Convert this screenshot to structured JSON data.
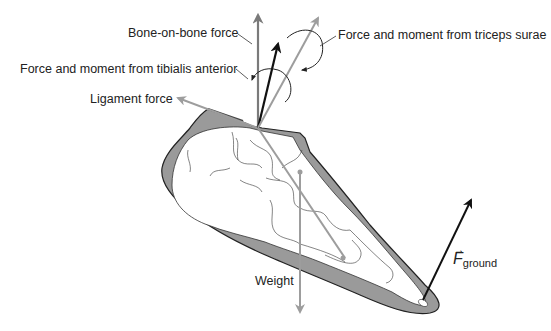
{
  "diagram": {
    "labels": {
      "bone_on_bone": "Bone-on-bone force",
      "tibialis": "Force and moment from tibialis anterior",
      "ligament": "Ligament force",
      "triceps": "Force and moment from triceps surae",
      "weight": "Weight",
      "ground_symbol": "F",
      "ground_subscript": "ground",
      "ground_vector_mark": "→"
    },
    "colors": {
      "soft_tissue": "#9a9a9a",
      "bone": "#ffffff",
      "outline": "#222222",
      "gray_vector": "#9d9d9d",
      "dark_gray_vector": "#7a7a7a",
      "black_vector": "#111111",
      "text": "#222222"
    },
    "forces": [
      {
        "name": "Bone-on-bone force",
        "color": "dark_gray",
        "from": [
          258,
          128
        ],
        "to": [
          258,
          15
        ]
      },
      {
        "name": "Force and moment from tibialis anterior",
        "color": "black",
        "from": [
          258,
          128
        ],
        "to": [
          278,
          44
        ]
      },
      {
        "name": "Force and moment from triceps surae",
        "color": "gray",
        "from": [
          258,
          128
        ],
        "to": [
          318,
          18
        ]
      },
      {
        "name": "Ligament force",
        "color": "gray",
        "from": [
          258,
          128
        ],
        "to": [
          178,
          98
        ]
      },
      {
        "name": "Weight",
        "color": "gray",
        "from": [
          300,
          200
        ],
        "to": [
          300,
          312
        ]
      },
      {
        "name": "F ground",
        "color": "black",
        "from": [
          423,
          295
        ],
        "to": [
          470,
          202
        ]
      }
    ]
  }
}
